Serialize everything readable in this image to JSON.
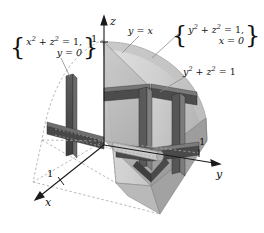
{
  "figure": {
    "background": "#ffffff",
    "colors": {
      "beam_dark": "#4a4a4a",
      "beam_mid": "#6e6e6e",
      "surface_light": "#d8d8d8",
      "surface_mid": "#bcbcbc",
      "surface_dark": "#9a9a9a",
      "axis": "#1a1a1a",
      "dashed": "#9d9d9d",
      "leader": "#7a7a7a",
      "text": "#111111"
    }
  },
  "axes": {
    "z": {
      "label": "z",
      "tick": "1"
    },
    "y": {
      "label": "y",
      "tick": "1"
    },
    "x": {
      "label": "x",
      "tick": "1"
    }
  },
  "annotations": {
    "plane_label": {
      "text": "y = x",
      "lhs": "y",
      "eq": "=",
      "rhs": "x"
    },
    "cylinder_label": {
      "base": "y",
      "exp1": "2",
      "plus": "+",
      "base2": "z",
      "exp2": "2",
      "rest": "= 1"
    },
    "left_brace_label": {
      "line1_base1": "x",
      "line1_exp1": "2",
      "line1_plus": "+",
      "line1_base2": "z",
      "line1_exp2": "2",
      "line1_rest": "= 1,",
      "line2": "y = 0"
    },
    "right_brace_label": {
      "line1_base1": "y",
      "line1_exp1": "2",
      "line1_plus": "+",
      "line1_base2": "z",
      "line1_exp2": "2",
      "line1_rest": "= 1,",
      "line2": "x = 0"
    },
    "brace_left": "{",
    "brace_right": "}"
  }
}
